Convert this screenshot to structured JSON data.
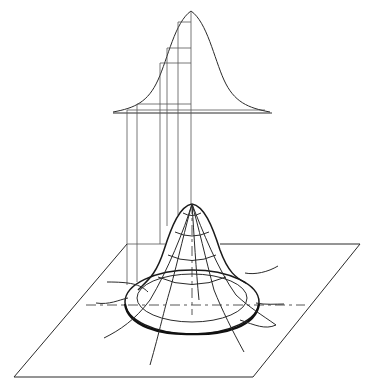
{
  "figure": {
    "labels": [],
    "colors": {
      "ink": "#2a2a2a",
      "background": "#ffffff"
    }
  },
  "top_curve": {
    "peak": [
      191,
      11
    ],
    "baseline_y": 113,
    "left_x": 38,
    "right_x": 345,
    "projection_lines_x": [
      127,
      137,
      160,
      167,
      178,
      191
    ]
  },
  "surface": {
    "peak": [
      192,
      204
    ],
    "plane_corners": [
      [
        127,
        244
      ],
      [
        360,
        244
      ],
      [
        253,
        377
      ],
      [
        14,
        377
      ]
    ],
    "axis_y": 305
  }
}
